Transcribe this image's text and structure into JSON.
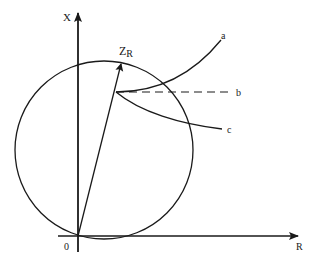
{
  "diagram": {
    "axes": {
      "vertical_label": "X",
      "horizontal_label": "R",
      "origin_label": "0"
    },
    "vector": {
      "label_main": "Z",
      "label_sub": "R"
    },
    "curves": [
      {
        "id": "a",
        "label": "a",
        "style": "solid"
      },
      {
        "id": "b",
        "label": "b",
        "style": "dashed"
      },
      {
        "id": "c",
        "label": "c",
        "style": "solid"
      }
    ],
    "colors": {
      "stroke": "#1a1a1a",
      "background": "#ffffff"
    }
  }
}
